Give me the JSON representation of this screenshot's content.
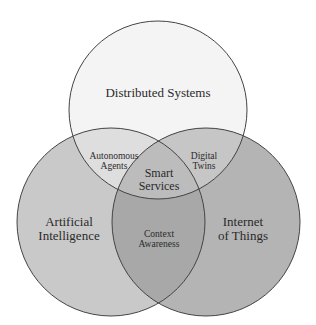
{
  "diagram": {
    "type": "venn",
    "sets": [
      {
        "id": "top",
        "label": "Distributed Systems",
        "fill": "#f3f3f3"
      },
      {
        "id": "left",
        "label_lines": [
          "Artificial",
          "Intelligence"
        ],
        "fill": "#c9c9c9"
      },
      {
        "id": "right",
        "label_lines": [
          "Internet",
          "of Things"
        ],
        "fill": "#b3b3b3"
      }
    ],
    "intersections": {
      "top_left": [
        "Autonomous",
        "Agents"
      ],
      "top_right": [
        "Digital",
        "Twins"
      ],
      "left_right": [
        "Context",
        "Awareness"
      ],
      "all": [
        "Smart",
        "Services"
      ]
    }
  }
}
